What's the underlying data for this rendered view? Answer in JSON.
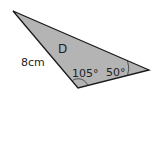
{
  "diagram": {
    "shape": "triangle",
    "name_label": "D",
    "side_label": "8cm",
    "angles": [
      {
        "vertex": "bottom",
        "label": "105°"
      },
      {
        "vertex": "right",
        "label": "50°"
      }
    ],
    "colors": {
      "fill": "#b4b4b4",
      "stroke": "#1a1a1a",
      "background": "#ffffff"
    }
  }
}
